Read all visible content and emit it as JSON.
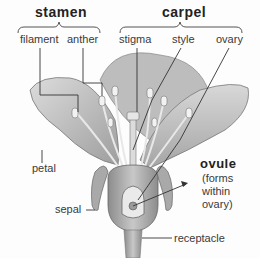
{
  "diagram": {
    "groups": {
      "stamen": "stamen",
      "carpel": "carpel"
    },
    "labels": {
      "filament": "filament",
      "anther": "anther",
      "stigma": "stigma",
      "style": "style",
      "ovary": "ovary",
      "petal": "petal",
      "sepal": "sepal",
      "ovule": "ovule",
      "ovule_note_1": "(forms",
      "ovule_note_2": "within",
      "ovule_note_3": "ovary)",
      "receptacle": "receptacle"
    },
    "colors": {
      "petal_fill": "#c9c9c9",
      "petal_shade": "#9a9a9a",
      "line": "#333333",
      "background": "#fdfdfd"
    }
  }
}
